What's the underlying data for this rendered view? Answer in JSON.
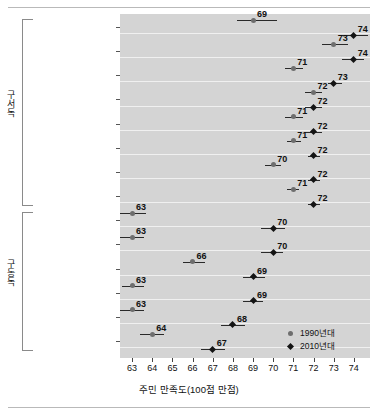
{
  "chart_data": {
    "type": "scatter",
    "title": "",
    "xlabel": "주민 만족도(100점 만점)",
    "ylabel": "",
    "xlim": [
      62.4,
      74.8
    ],
    "xticks": [
      63,
      64,
      65,
      66,
      67,
      68,
      69,
      70,
      71,
      72,
      73,
      74
    ],
    "grid": true,
    "legend_position": "bottom-right",
    "legend": [
      "1990년대",
      "2010년대"
    ],
    "series": [
      {
        "name": "1990년대",
        "marker": "circle",
        "color": "#6e6e6e"
      },
      {
        "name": "2010년대",
        "marker": "diamond",
        "color": "#141414"
      }
    ],
    "groups": [
      {
        "label": "구서독",
        "categories": [
          "함부르크",
          "슐레스비히홀슈타인",
          "니더작센",
          "헤센",
          "라인란트팔츠",
          "바이에른",
          "바덴뷔르템베르크",
          "노르트라인베스트팔렌"
        ]
      },
      {
        "label": "구동독",
        "categories": [
          "메클렌부르크포어포메른",
          "튀링겐",
          "베를린",
          "작센",
          "작센안할트",
          "브란덴부르크"
        ]
      }
    ],
    "categories": [
      "함부르크",
      "슐레스비히홀슈타인",
      "니더작센",
      "헤센",
      "라인란트팔츠",
      "바이에른",
      "바덴뷔르템베르크",
      "노르트라인베스트팔렌",
      "메클렌부르크포어포메른",
      "튀링겐",
      "베를린",
      "작센",
      "작센안할트",
      "브란덴부르크"
    ],
    "points": [
      {
        "category": "함부르크",
        "v1990": 69,
        "v1990_lo": 68.2,
        "v1990_hi": 70.2,
        "v2010": 74,
        "v2010_lo": 73.3,
        "v2010_hi": 74.7
      },
      {
        "category": "슐레스비히홀슈타인",
        "v1990": 73,
        "v1990_lo": 72.4,
        "v1990_hi": 73.7,
        "v2010": 74,
        "v2010_lo": 73.4,
        "v2010_hi": 74.5
      },
      {
        "category": "니더작센",
        "v1990": 71,
        "v1990_lo": 70.6,
        "v1990_hi": 71.5,
        "v2010": 73,
        "v2010_lo": 72.7,
        "v2010_hi": 73.4
      },
      {
        "category": "헤센",
        "v1990": 72,
        "v1990_lo": 71.6,
        "v1990_hi": 72.4,
        "v2010": 72,
        "v2010_lo": 71.6,
        "v2010_hi": 72.4
      },
      {
        "category": "라인란트팔츠",
        "v1990": 71,
        "v1990_lo": 70.6,
        "v1990_hi": 71.5,
        "v2010": 72,
        "v2010_lo": 71.6,
        "v2010_hi": 72.4
      },
      {
        "category": "바이에른",
        "v1990": 71,
        "v1990_lo": 70.7,
        "v1990_hi": 71.4,
        "v2010": 72,
        "v2010_lo": 71.7,
        "v2010_hi": 72.3
      },
      {
        "category": "바덴뷔르템베르크",
        "v1990": 70,
        "v1990_lo": 69.6,
        "v1990_hi": 70.4,
        "v2010": 72,
        "v2010_lo": 71.7,
        "v2010_hi": 72.3
      },
      {
        "category": "노르트라인베스트팔렌",
        "v1990": 71,
        "v1990_lo": 70.7,
        "v1990_hi": 71.3,
        "v2010": 72,
        "v2010_lo": 71.7,
        "v2010_hi": 72.3
      },
      {
        "category": "메클렌부르크포어포메른",
        "v1990": 63,
        "v1990_lo": 62.4,
        "v1990_hi": 63.7,
        "v2010": 70,
        "v2010_lo": 69.4,
        "v2010_hi": 70.6
      },
      {
        "category": "튀링겐",
        "v1990": 63,
        "v1990_lo": 62.4,
        "v1990_hi": 63.6,
        "v2010": 70,
        "v2010_lo": 69.4,
        "v2010_hi": 70.5
      },
      {
        "category": "베를린",
        "v1990": 66,
        "v1990_lo": 65.5,
        "v1990_hi": 66.6,
        "v2010": 69,
        "v2010_lo": 68.5,
        "v2010_hi": 69.6
      },
      {
        "category": "작센",
        "v1990": 63,
        "v1990_lo": 62.5,
        "v1990_hi": 63.6,
        "v2010": 69,
        "v2010_lo": 68.5,
        "v2010_hi": 69.5
      },
      {
        "category": "작센안할트",
        "v1990": 63,
        "v1990_lo": 62.4,
        "v1990_hi": 63.6,
        "v2010": 68,
        "v2010_lo": 67.4,
        "v2010_hi": 68.6
      },
      {
        "category": "브란덴부르크",
        "v1990": 64,
        "v1990_lo": 63.4,
        "v1990_hi": 64.6,
        "v2010": 67,
        "v2010_lo": 66.4,
        "v2010_hi": 67.6
      }
    ]
  }
}
